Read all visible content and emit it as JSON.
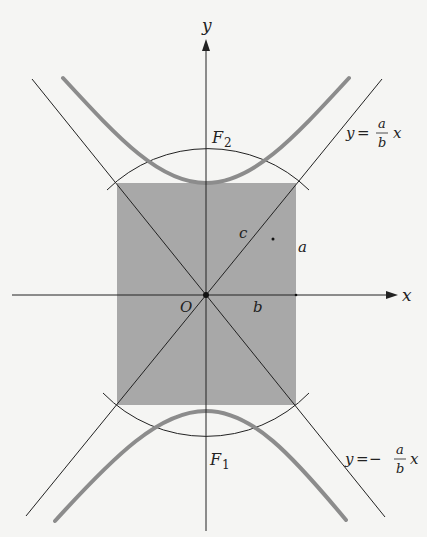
{
  "diagram": {
    "type": "hyperbola-geometry",
    "colors": {
      "background": "#f5f5f3",
      "rectangle_fill": "#a8a8a8",
      "hyperbola_stroke": "#8c8c8c",
      "line_stroke": "#222222"
    },
    "axes": {
      "x_label": "x",
      "y_label": "y",
      "origin_label": "O"
    },
    "foci": {
      "upper": {
        "name": "F",
        "sub": "2"
      },
      "lower": {
        "name": "F",
        "sub": "1"
      }
    },
    "segment_labels": {
      "semi_minor": "b",
      "semi_major": "a",
      "focal_distance": "c"
    },
    "asymptotes": {
      "positive": {
        "lhs": "y",
        "eq": "=",
        "sign": "",
        "num": "a",
        "den": "b",
        "var": "x"
      },
      "negative": {
        "lhs": "y",
        "eq": "=",
        "sign": "−",
        "num": "a",
        "den": "b",
        "var": "x"
      }
    }
  }
}
